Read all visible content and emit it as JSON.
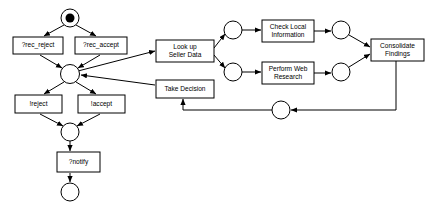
{
  "diagram": {
    "type": "petri-net-workflow",
    "background_color": "#ffffff",
    "line_color": "#000000",
    "fill_color": "#ffffff",
    "transitions": [
      {
        "id": "rec_reject",
        "label": "?rec_reject",
        "x": 13,
        "y": 37,
        "w": 50,
        "h": 17,
        "lines": [
          "?rec_reject"
        ]
      },
      {
        "id": "rec_accept",
        "label": "?rec_accept",
        "x": 75,
        "y": 37,
        "w": 52,
        "h": 17,
        "lines": [
          "?rec_accept"
        ]
      },
      {
        "id": "reject",
        "label": "!reject",
        "x": 15,
        "y": 95,
        "w": 47,
        "h": 18,
        "lines": [
          "!reject"
        ]
      },
      {
        "id": "accept",
        "label": "!accept",
        "x": 78,
        "y": 95,
        "w": 47,
        "h": 18,
        "lines": [
          "!accept"
        ]
      },
      {
        "id": "notify",
        "label": "?notify",
        "x": 57,
        "y": 152,
        "w": 43,
        "h": 20,
        "lines": [
          "?notify"
        ]
      },
      {
        "id": "lookup_seller",
        "label": "Look up Seller Data",
        "x": 156,
        "y": 40,
        "w": 58,
        "h": 22,
        "lines": [
          "Look up",
          "Seller Data"
        ]
      },
      {
        "id": "take_decision",
        "label": "Take Decision",
        "x": 156,
        "y": 80,
        "w": 58,
        "h": 18,
        "lines": [
          "Take Decision"
        ]
      },
      {
        "id": "check_local",
        "label": "Check Local Information",
        "x": 262,
        "y": 20,
        "w": 52,
        "h": 22,
        "lines": [
          "Check Local",
          "Information"
        ]
      },
      {
        "id": "web_research",
        "label": "Perform Web Research",
        "x": 262,
        "y": 62,
        "w": 52,
        "h": 22,
        "lines": [
          "Perform Web",
          "Research"
        ]
      },
      {
        "id": "consolidate",
        "label": "Consolidate Findings",
        "x": 371,
        "y": 39,
        "w": 53,
        "h": 22,
        "lines": [
          "Consolidate",
          "Findings"
        ]
      }
    ],
    "places": [
      {
        "id": "p_start",
        "cx": 70,
        "cy": 18,
        "r": 9,
        "token": true
      },
      {
        "id": "p_middle",
        "cx": 70,
        "cy": 74,
        "r": 9.5,
        "token": false
      },
      {
        "id": "p_after_act",
        "cx": 70,
        "cy": 132,
        "r": 9,
        "token": false
      },
      {
        "id": "p_end",
        "cx": 70,
        "cy": 192,
        "r": 9,
        "token": false
      },
      {
        "id": "p_local_in",
        "cx": 233,
        "cy": 30,
        "r": 9,
        "token": false
      },
      {
        "id": "p_web_in",
        "cx": 233,
        "cy": 72,
        "r": 9,
        "token": false
      },
      {
        "id": "p_local_out",
        "cx": 341,
        "cy": 30,
        "r": 9,
        "token": false
      },
      {
        "id": "p_web_out",
        "cx": 341,
        "cy": 72,
        "r": 9,
        "token": false
      },
      {
        "id": "p_loop",
        "cx": 281,
        "cy": 110,
        "r": 9,
        "token": false
      }
    ],
    "edges": [
      {
        "from": "p_start",
        "to": "rec_reject",
        "d": "M 64,25 L 44,36"
      },
      {
        "from": "p_start",
        "to": "rec_accept",
        "d": "M 76,25 L 96,36"
      },
      {
        "from": "rec_reject",
        "to": "p_middle",
        "d": "M 40,55 L 62,68"
      },
      {
        "from": "rec_accept",
        "to": "p_middle",
        "d": "M 100,55 L 78,68"
      },
      {
        "from": "p_middle",
        "to": "reject",
        "d": "M 64,82 L 44,94"
      },
      {
        "from": "p_middle",
        "to": "accept",
        "d": "M 76,82 L 96,94"
      },
      {
        "from": "reject",
        "to": "p_after_act",
        "d": "M 40,114 L 63,126"
      },
      {
        "from": "accept",
        "to": "p_after_act",
        "d": "M 100,114 L 77,126"
      },
      {
        "from": "p_after_act",
        "to": "notify",
        "d": "M 70,141 L 70,151"
      },
      {
        "from": "notify",
        "to": "p_end",
        "d": "M 70,173 L 70,182"
      },
      {
        "from": "p_middle",
        "to": "lookup_seller",
        "d": "M 78,71 L 155,51"
      },
      {
        "from": "take_decision",
        "to": "p_middle",
        "d": "M 155,85 L 81,75"
      },
      {
        "from": "lookup_seller",
        "to": "p_local_in",
        "d": "M 214,48 L 225,34"
      },
      {
        "from": "lookup_seller",
        "to": "p_web_in",
        "d": "M 214,55 L 225,68"
      },
      {
        "from": "p_local_in",
        "to": "check_local",
        "d": "M 242,30 L 261,30"
      },
      {
        "from": "p_web_in",
        "to": "web_research",
        "d": "M 242,72 L 261,72"
      },
      {
        "from": "check_local",
        "to": "p_local_out",
        "d": "M 314,31 L 331,31"
      },
      {
        "from": "web_research",
        "to": "p_web_out",
        "d": "M 314,73 L 331,73"
      },
      {
        "from": "p_local_out",
        "to": "consolidate",
        "d": "M 349,35 L 370,47"
      },
      {
        "from": "p_web_out",
        "to": "consolidate",
        "d": "M 349,67 L 370,54"
      },
      {
        "from": "consolidate",
        "to": "p_loop",
        "d": "M 396,61 L 396,110 L 291,110"
      },
      {
        "from": "p_loop",
        "to": "take_decision",
        "d": "M 272,110 L 183,110 L 183,99"
      }
    ]
  }
}
